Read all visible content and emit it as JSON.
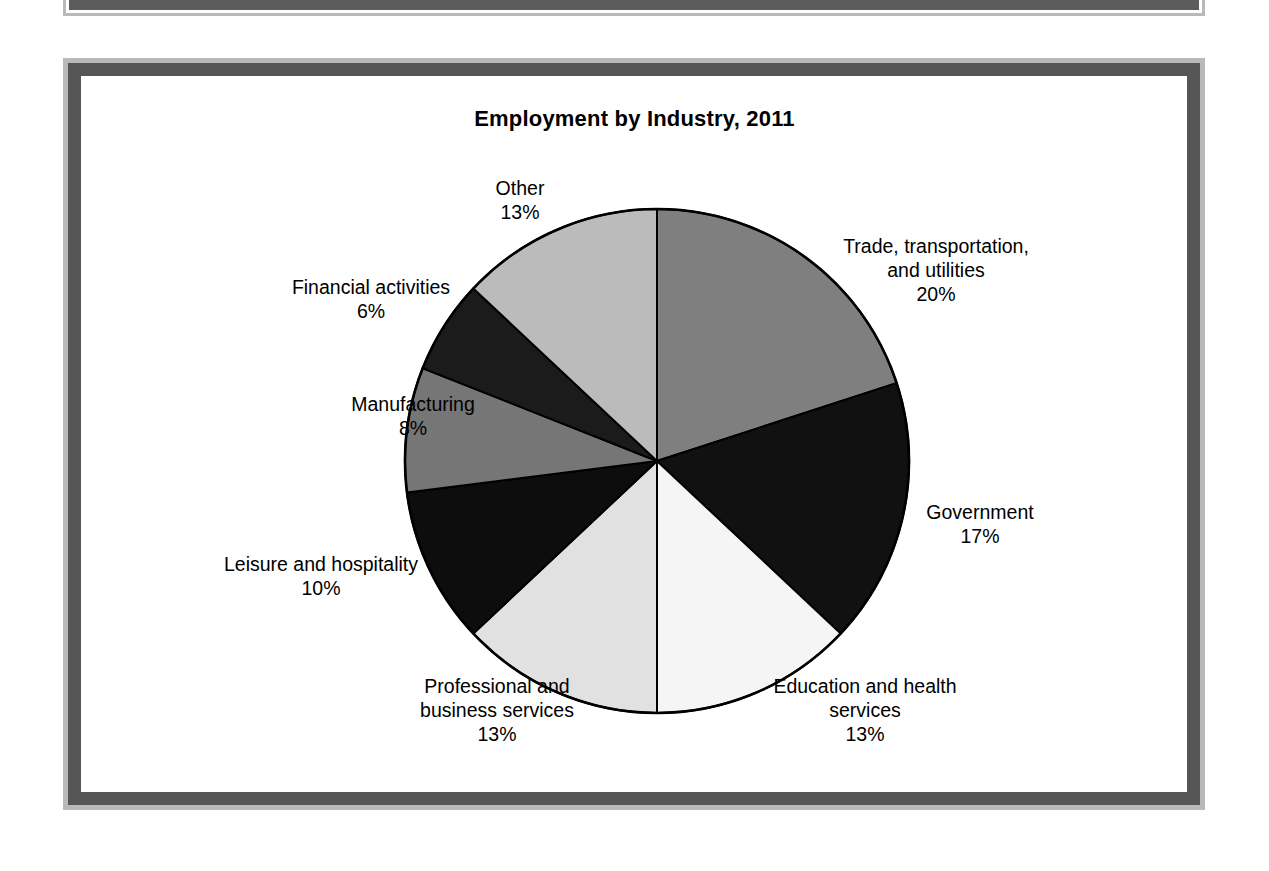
{
  "figure": {
    "title": "Employment by Industry, 2011"
  },
  "chart_data": {
    "type": "pie",
    "title": "Employment by Industry, 2011",
    "xlabel": "",
    "ylabel": "",
    "units": "percent",
    "legend_position": "none",
    "grid": false,
    "start_angle_deg": 0,
    "direction": "clockwise",
    "categories": [
      "Trade, transportation, and utilities",
      "Government",
      "Education and health services",
      "Professional and business services",
      "Leisure and hospitality",
      "Manufacturing",
      "Financial activities",
      "Other"
    ],
    "values": [
      20,
      17,
      13,
      13,
      10,
      8,
      6,
      13
    ],
    "slices": [
      {
        "key": "trade",
        "name_lines": [
          "Trade, transportation,",
          "and utilities"
        ],
        "label": "Trade, transportation, and utilities",
        "value": 20,
        "pct_text": "20%",
        "color": "#7f7f7f"
      },
      {
        "key": "government",
        "name_lines": [
          "Government"
        ],
        "label": "Government",
        "value": 17,
        "pct_text": "17%",
        "color": "#111111"
      },
      {
        "key": "education",
        "name_lines": [
          "Education and health",
          "services"
        ],
        "label": "Education and health services",
        "value": 13,
        "pct_text": "13%",
        "color": "#f5f5f5"
      },
      {
        "key": "professional",
        "name_lines": [
          "Professional and",
          "business services"
        ],
        "label": "Professional and business services",
        "value": 13,
        "pct_text": "13%",
        "color": "#e1e1e1"
      },
      {
        "key": "leisure",
        "name_lines": [
          "Leisure and hospitality"
        ],
        "label": "Leisure and hospitality",
        "value": 10,
        "pct_text": "10%",
        "color": "#0d0d0d"
      },
      {
        "key": "manufacturing",
        "name_lines": [
          "Manufacturing"
        ],
        "label": "Manufacturing",
        "value": 8,
        "pct_text": "8%",
        "color": "#767676"
      },
      {
        "key": "financial",
        "name_lines": [
          "Financial activities"
        ],
        "label": "Financial activities",
        "value": 6,
        "pct_text": "6%",
        "color": "#1b1b1b"
      },
      {
        "key": "other",
        "name_lines": [
          "Other"
        ],
        "label": "Other",
        "value": 13,
        "pct_text": "13%",
        "color": "#bbbbbb"
      }
    ]
  },
  "labels": {
    "trade": {
      "line1": "Trade, transportation,",
      "line2": "and utilities",
      "pct": "20%"
    },
    "government": {
      "line1": "Government",
      "line2": "",
      "pct": "17%"
    },
    "education": {
      "line1": "Education and health",
      "line2": "services",
      "pct": "13%"
    },
    "professional": {
      "line1": "Professional and",
      "line2": "business services",
      "pct": "13%"
    },
    "leisure": {
      "line1": "Leisure and hospitality",
      "line2": "",
      "pct": "10%"
    },
    "manufacturing": {
      "line1": "Manufacturing",
      "line2": "",
      "pct": "8%"
    },
    "financial": {
      "line1": "Financial activities",
      "line2": "",
      "pct": "6%"
    },
    "other": {
      "line1": "Other",
      "line2": "",
      "pct": "13%"
    }
  },
  "style": {
    "frame_outer_color": "#b9b9b9",
    "frame_inner_color": "#565656",
    "page_background": "#ffffff",
    "outline_color": "#000000"
  }
}
